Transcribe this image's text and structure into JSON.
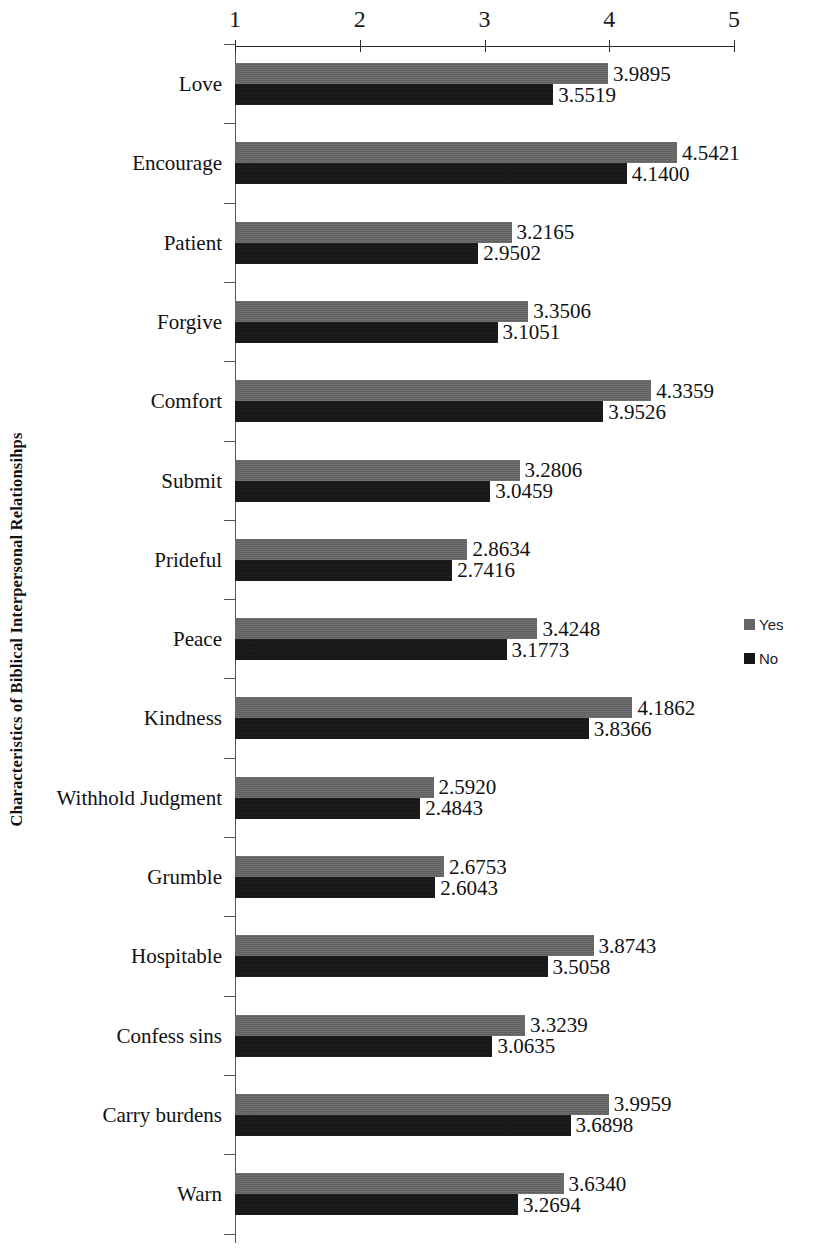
{
  "chart_data": {
    "type": "bar",
    "orientation": "horizontal",
    "title": "",
    "xlabel": "",
    "ylabel": "Characteristics of Biblical Interpersonal Relationsihps",
    "xlim": [
      1,
      5
    ],
    "xticks": [
      "1",
      "2",
      "3",
      "4",
      "5"
    ],
    "grid": false,
    "legend_position": "right",
    "axis_position": "top",
    "categories": [
      "Love",
      "Encourage",
      "Patient",
      "Forgive",
      "Comfort",
      "Submit",
      "Prideful",
      "Peace",
      "Kindness",
      "Withhold Judgment",
      "Grumble",
      "Hospitable",
      "Confess sins",
      "Carry burdens",
      "Warn"
    ],
    "series": [
      {
        "name": "Yes",
        "color": "#666666",
        "values": [
          3.9895,
          4.5421,
          3.2165,
          3.3506,
          4.3359,
          3.2806,
          2.8634,
          3.4248,
          4.1862,
          2.592,
          2.6753,
          3.8743,
          3.3239,
          3.9959,
          3.634
        ],
        "labels": [
          "3.9895",
          "4.5421",
          "3.2165",
          "3.3506",
          "4.3359",
          "3.2806",
          "2.8634",
          "3.4248",
          "4.1862",
          "2.5920",
          "2.6753",
          "3.8743",
          "3.3239",
          "3.9959",
          "3.6340"
        ]
      },
      {
        "name": "No",
        "color": "#161616",
        "values": [
          3.5519,
          4.14,
          2.9502,
          3.1051,
          3.9526,
          3.0459,
          2.7416,
          3.1773,
          3.8366,
          2.4843,
          2.6043,
          3.5058,
          3.0635,
          3.6898,
          3.2694
        ],
        "labels": [
          "3.5519",
          "4.1400",
          "2.9502",
          "3.1051",
          "3.9526",
          "3.0459",
          "2.7416",
          "3.1773",
          "3.8366",
          "2.4843",
          "2.6043",
          "3.5058",
          "3.0635",
          "3.6898",
          "3.2694"
        ]
      }
    ]
  },
  "legend": {
    "items": [
      {
        "label": "Yes",
        "color": "#666666"
      },
      {
        "label": "No",
        "color": "#161616"
      }
    ]
  }
}
